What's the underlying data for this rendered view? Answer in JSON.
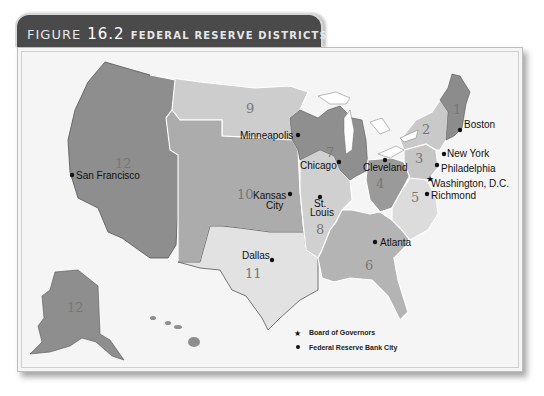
{
  "figure": {
    "prefix": "FIGURE",
    "number": "16.2",
    "title": "FEDERAL RESERVE DISTRICTS"
  },
  "colors": {
    "tab_bg": "#4a4a4a",
    "panel_bg": "#f5f5f5",
    "dark_district": "#8c8c8c",
    "mid_district": "#a8a8a8",
    "light_district": "#c4c4c4",
    "pale_district": "#dedede",
    "water": "#ffffff"
  },
  "districts": [
    {
      "number": "1",
      "label": "1"
    },
    {
      "number": "2",
      "label": "2"
    },
    {
      "number": "3",
      "label": "3"
    },
    {
      "number": "4",
      "label": "4"
    },
    {
      "number": "5",
      "label": "5"
    },
    {
      "number": "6",
      "label": "6"
    },
    {
      "number": "7",
      "label": "7"
    },
    {
      "number": "8",
      "label": "8"
    },
    {
      "number": "9",
      "label": "9"
    },
    {
      "number": "10",
      "label": "10"
    },
    {
      "number": "11",
      "label": "11"
    },
    {
      "number": "12",
      "label": "12"
    }
  ],
  "cities": [
    {
      "name": "Boston",
      "type": "bank"
    },
    {
      "name": "New York",
      "type": "bank"
    },
    {
      "name": "Philadelphia",
      "type": "bank"
    },
    {
      "name": "Washington, D.C.",
      "type": "board"
    },
    {
      "name": "Richmond",
      "type": "bank"
    },
    {
      "name": "Cleveland",
      "type": "bank"
    },
    {
      "name": "Chicago",
      "type": "bank"
    },
    {
      "name": "Minneapolis",
      "type": "bank"
    },
    {
      "name": "Kansas City",
      "line1": "Kansas",
      "line2": "City",
      "type": "bank"
    },
    {
      "name": "St. Louis",
      "line1": "St.",
      "line2": "Louis",
      "type": "bank"
    },
    {
      "name": "Atlanta",
      "type": "bank"
    },
    {
      "name": "Dallas",
      "type": "bank"
    },
    {
      "name": "San Francisco",
      "type": "bank"
    }
  ],
  "legend": {
    "items": [
      {
        "icon": "star-icon",
        "glyph": "★",
        "label": "Board of Governors"
      },
      {
        "icon": "dot-icon",
        "glyph": "●",
        "label": "Federal Reserve Bank City"
      }
    ]
  }
}
